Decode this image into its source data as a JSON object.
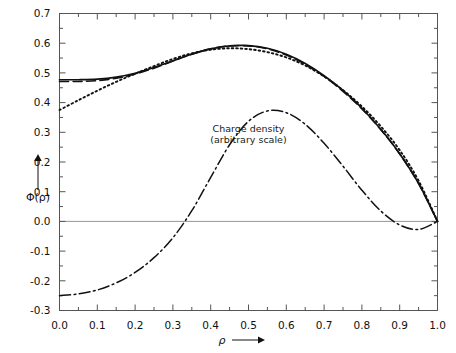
{
  "chart_data": {
    "type": "line",
    "title": "",
    "xlabel": "ρ",
    "ylabel": "Φ(ρ)",
    "xlim": [
      0.0,
      1.0
    ],
    "ylim": [
      -0.3,
      0.7
    ],
    "grid": false,
    "legend_position": "none",
    "xticks": [
      "0.0",
      "0.1",
      "0.2",
      "0.3",
      "0.4",
      "0.5",
      "0.6",
      "0.7",
      "0.8",
      "0.9",
      "1.0"
    ],
    "xtick_values": [
      0.0,
      0.1,
      0.2,
      0.3,
      0.4,
      0.5,
      0.6,
      0.7,
      0.8,
      0.9,
      1.0
    ],
    "yticks": [
      "0.7",
      "0.6",
      "0.5",
      "0.4",
      "0.3",
      "0.2",
      "0.1",
      "0.0",
      "-0.1",
      "-0.2",
      "-0.3"
    ],
    "ytick_values": [
      0.7,
      0.6,
      0.5,
      0.4,
      0.3,
      0.2,
      0.1,
      0.0,
      -0.1,
      -0.2,
      -0.3
    ],
    "minor_tick_step_x": 0.05,
    "minor_tick_step_y": 0.05,
    "x": [
      0.0,
      0.05,
      0.1,
      0.15,
      0.2,
      0.25,
      0.3,
      0.35,
      0.4,
      0.45,
      0.5,
      0.55,
      0.6,
      0.65,
      0.7,
      0.75,
      0.8,
      0.85,
      0.9,
      0.95,
      1.0
    ],
    "series": [
      {
        "name": "solid-curve",
        "style": "solid",
        "color": "#111111",
        "values": [
          0.477,
          0.477,
          0.479,
          0.486,
          0.499,
          0.518,
          0.541,
          0.563,
          0.581,
          0.591,
          0.592,
          0.583,
          0.563,
          0.532,
          0.491,
          0.441,
          0.381,
          0.31,
          0.228,
          0.128,
          0.0
        ]
      },
      {
        "name": "dashed-curve",
        "style": "dashed",
        "color": "#111111",
        "values": [
          0.471,
          0.471,
          0.474,
          0.482,
          0.496,
          0.516,
          0.54,
          0.563,
          0.581,
          0.591,
          0.591,
          0.581,
          0.56,
          0.529,
          0.488,
          0.438,
          0.379,
          0.309,
          0.227,
          0.127,
          0.0
        ]
      },
      {
        "name": "dotted-curve",
        "style": "dotted",
        "color": "#111111",
        "values": [
          0.375,
          0.408,
          0.44,
          0.47,
          0.497,
          0.523,
          0.547,
          0.566,
          0.578,
          0.583,
          0.58,
          0.57,
          0.552,
          0.525,
          0.488,
          0.442,
          0.387,
          0.32,
          0.24,
          0.137,
          0.0
        ]
      },
      {
        "name": "charge-density-curve",
        "style": "dashdot",
        "color": "#111111",
        "values": [
          -0.25,
          -0.244,
          -0.231,
          -0.207,
          -0.172,
          -0.122,
          -0.055,
          0.036,
          0.148,
          0.258,
          0.337,
          0.372,
          0.366,
          0.327,
          0.263,
          0.186,
          0.105,
          0.035,
          -0.012,
          -0.027,
          0.0
        ]
      }
    ],
    "annotations": [
      {
        "name": "charge-density-label",
        "line1": "Charge density",
        "line2": "(arbitrary scale)",
        "x": 0.5,
        "y": 0.3
      }
    ],
    "zero_reference_line": 0.0
  },
  "axes": {
    "y_axis_arrow": "up-arrow",
    "x_axis_arrow": "right-arrow"
  }
}
